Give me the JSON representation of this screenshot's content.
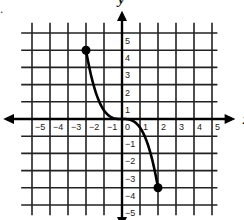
{
  "corner_mark": ".",
  "chart_data": {
    "type": "line",
    "title": "",
    "xlabel": "x",
    "ylabel": "y",
    "xlim": [
      -5,
      5
    ],
    "ylim": [
      -5,
      5
    ],
    "grid": true,
    "x_ticks": [
      "-5",
      "-4",
      "-3",
      "-2",
      "-1",
      "0",
      "1",
      "2",
      "3",
      "4",
      "5"
    ],
    "y_ticks": [
      "5",
      "4",
      "3",
      "2",
      "1",
      "-1",
      "-2",
      "-3",
      "-4",
      "-5"
    ],
    "series": [
      {
        "name": "curve",
        "function": "y = -x^3/2",
        "points": [
          [
            -2,
            4
          ],
          [
            -1.5,
            1.69
          ],
          [
            -1,
            0.5
          ],
          [
            -0.5,
            0.06
          ],
          [
            0,
            0
          ],
          [
            0.5,
            -0.06
          ],
          [
            1,
            -0.5
          ],
          [
            1.5,
            -1.69
          ],
          [
            2,
            -4
          ]
        ],
        "endpoints": [
          {
            "x": -2,
            "y": 4,
            "closed": true
          },
          {
            "x": 2,
            "y": -4,
            "closed": true
          }
        ]
      }
    ]
  }
}
